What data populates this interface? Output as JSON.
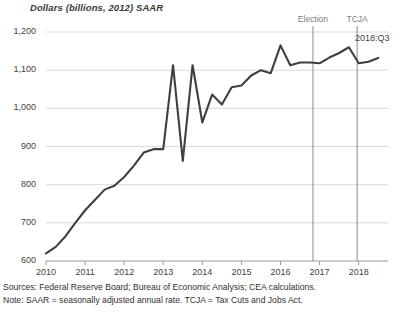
{
  "chart_data": {
    "type": "line",
    "title": "Dollars (billions, 2012) SAAR",
    "xlabel": "",
    "ylabel": "Dollars (billions, 2012) SAAR",
    "ylim": [
      600,
      1200
    ],
    "yticks": [
      600,
      700,
      800,
      900,
      1000,
      1100,
      1200
    ],
    "ytick_labels": [
      "600",
      "700",
      "800",
      "900",
      "1,000",
      "1,100",
      "1,200"
    ],
    "xlim": [
      2010.0,
      2018.75
    ],
    "xticks": [
      2010,
      2011,
      2012,
      2013,
      2014,
      2015,
      2016,
      2017,
      2018
    ],
    "xtick_labels": [
      "2010",
      "2011",
      "2012",
      "2013",
      "2014",
      "2015",
      "2016",
      "2017",
      "2018"
    ],
    "grid": "horizontal",
    "legend": "none",
    "series": [
      {
        "name": "Business fixed investment in equipment",
        "color": "#3f3f3f",
        "x": [
          2010.0,
          2010.25,
          2010.5,
          2010.75,
          2011.0,
          2011.25,
          2011.5,
          2011.75,
          2012.0,
          2012.25,
          2012.5,
          2012.75,
          2013.0,
          2013.25,
          2013.5,
          2013.75,
          2014.0,
          2014.25,
          2014.5,
          2014.75,
          2015.0,
          2015.25,
          2015.5,
          2015.75,
          2016.0,
          2016.25,
          2016.5,
          2016.75,
          2017.0,
          2017.25,
          2017.5,
          2017.75,
          2018.0,
          2018.25,
          2018.5
        ],
        "values": [
          620,
          637,
          665,
          700,
          733,
          760,
          787,
          797,
          820,
          850,
          884,
          893,
          893,
          1113,
          862,
          1113,
          963,
          1036,
          1010,
          1055,
          1060,
          1086,
          1100,
          1092,
          1165,
          1113,
          1120,
          1120,
          1118,
          1133,
          1145,
          1160,
          1118,
          1122,
          1132
        ]
      }
    ],
    "annotations": [
      {
        "name": "election-marker",
        "label": "Election",
        "x": 2016.83,
        "type": "vline"
      },
      {
        "name": "tcja-marker",
        "label": "TCJA",
        "x": 2017.96,
        "type": "vline"
      },
      {
        "name": "endpoint-label",
        "label": "2018:Q3",
        "x": 2018.5,
        "type": "text"
      }
    ]
  },
  "footnotes": {
    "sources": "Sources: Federal Reserve Board; Bureau of Economic Analysis; CEA calculations.",
    "note": "Note: SAAR = seasonally adjusted annual rate. TCJA = Tax Cuts and Jobs Act."
  },
  "colors": {
    "line": "#3f3f3f",
    "grid": "#d9d9d9",
    "axis": "#9a9a9a",
    "event_line": "#8c8c8c",
    "text": "#3f3f3f",
    "event_text": "#7d7d7d"
  }
}
